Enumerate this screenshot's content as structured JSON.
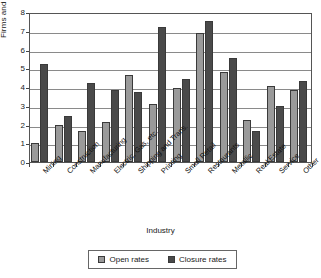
{
  "chart_data": {
    "type": "bar",
    "title": "",
    "xlabel": "Industry",
    "ylabel": "Firms and Enterprises",
    "ylim": [
      0,
      8
    ],
    "yticks": [
      0,
      1,
      2,
      3,
      4,
      5,
      6,
      7,
      8
    ],
    "grid": true,
    "legend_position": "bottom",
    "categories": [
      "Mining",
      "Construction",
      "Manufacturing",
      "Electric, Gas, etc.",
      "Shipping and Trans.",
      "Printing",
      "Small Retail",
      "Restaurants",
      "Metallic",
      "Real Estate",
      "Service",
      "Other"
    ],
    "series": [
      {
        "name": "Open rates",
        "color": "#9a9a9a",
        "values": [
          1.0,
          2.0,
          1.65,
          2.15,
          4.65,
          3.1,
          3.95,
          6.9,
          4.8,
          2.25,
          4.05,
          3.85
        ]
      },
      {
        "name": "Closure rates",
        "color": "#4a4a4a",
        "values": [
          5.25,
          2.45,
          4.2,
          3.85,
          3.75,
          7.2,
          4.45,
          7.5,
          5.55,
          1.65,
          3.0,
          4.3
        ]
      }
    ]
  }
}
